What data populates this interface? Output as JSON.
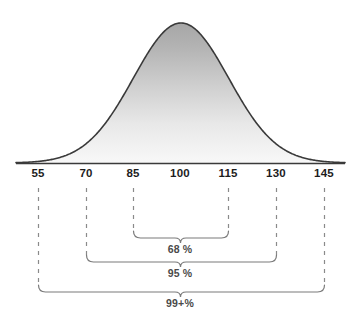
{
  "chart_data": {
    "type": "line",
    "title": "",
    "subtitle": "",
    "xlabel": "",
    "ylabel": "",
    "distribution": "normal",
    "mean": 100,
    "std_dev": 15,
    "xlim": [
      48,
      152
    ],
    "ylim": [
      0,
      1
    ],
    "grid": false,
    "legend": null,
    "x_ticks": [
      {
        "value": 55,
        "label": "55",
        "px": 38
      },
      {
        "value": 70,
        "label": "70",
        "px": 86
      },
      {
        "value": 85,
        "label": "85",
        "px": 133
      },
      {
        "value": 100,
        "label": "100",
        "px": 180
      },
      {
        "value": 115,
        "label": "115",
        "px": 228
      },
      {
        "value": 130,
        "label": "130",
        "px": 276
      },
      {
        "value": 145,
        "label": "145",
        "px": 324
      }
    ],
    "curve": {
      "name": "normal-distribution-curve",
      "peak_x": 100,
      "peak_y": 1.0,
      "stroke": "#3a3a3a",
      "fill_top": "#a9a9a9",
      "fill_bottom": "#f7f7f7"
    },
    "annotations": [
      {
        "name": "one-sigma-bracket",
        "label": "68 %",
        "from_value": 85,
        "to_value": 115,
        "from_px": 133,
        "to_px": 228,
        "label_px": 180,
        "bracket_y": 238,
        "label_y": 243
      },
      {
        "name": "two-sigma-bracket",
        "label": "95 %",
        "from_value": 70,
        "to_value": 130,
        "from_px": 86,
        "to_px": 276,
        "label_px": 180,
        "bracket_y": 262,
        "label_y": 267
      },
      {
        "name": "three-sigma-bracket",
        "label": "99+%",
        "from_value": 55,
        "to_value": 145,
        "from_px": 38,
        "to_px": 324,
        "label_px": 180,
        "bracket_y": 292,
        "label_y": 297
      }
    ],
    "dashed_guides": [
      38,
      86,
      133,
      228,
      276,
      324
    ],
    "axis": {
      "y_px": 163,
      "x_start_px": 16,
      "x_end_px": 345,
      "color": "#3a3a3a"
    },
    "colors": {
      "background": "#ffffff",
      "axis": "#3a3a3a",
      "tick_text": "#1d1d1d",
      "bracket": "#7a7a7a",
      "bracket_text": "#4a4a4a",
      "dashed_guide": "#8a8a8a",
      "curve_stroke": "#3a3a3a"
    }
  }
}
